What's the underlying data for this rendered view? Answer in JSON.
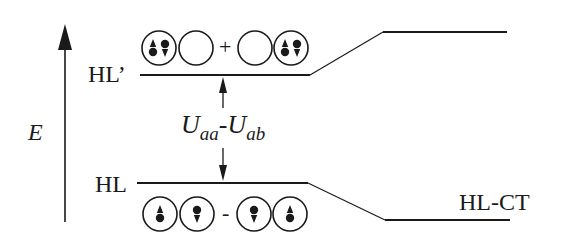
{
  "diagram": {
    "axis": {
      "label": "E"
    },
    "levels": {
      "upper": {
        "label": "HL’",
        "sign": "+"
      },
      "lower": {
        "label": "HL",
        "sign": "-"
      },
      "ct": {
        "label": "HL-CT"
      }
    },
    "gap_label": {
      "main": "U",
      "sub1": "aa",
      "sep": "-",
      "main2": "U",
      "sub2": "ab"
    },
    "upper_orbitals": [
      "doubly-occupied (up+down)",
      "empty",
      "empty",
      "doubly-occupied (up+down)"
    ],
    "lower_orbitals": [
      "spin-up",
      "spin-down",
      "spin-down",
      "spin-up"
    ],
    "colors": {
      "ink": "#1a1a1a",
      "background": "#ffffff"
    }
  }
}
